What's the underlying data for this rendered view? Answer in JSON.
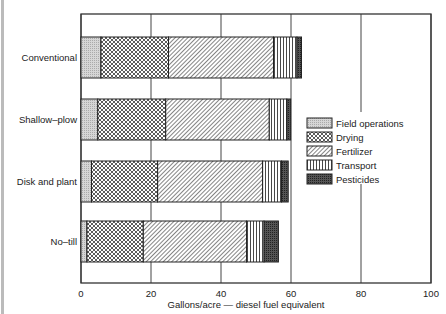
{
  "chart_data": {
    "type": "bar",
    "orientation": "horizontal",
    "stacked": true,
    "title": "",
    "xlabel": "Gallons/acre — diesel fuel equivalent",
    "ylabel": "",
    "xlim": [
      0,
      100
    ],
    "xticks": [
      0,
      20,
      40,
      60,
      80,
      100
    ],
    "grid": true,
    "legend_position": "right-middle inside",
    "categories": [
      "Conventional",
      "Shallow–plow",
      "Disk and plant",
      "No–till"
    ],
    "series": [
      {
        "name": "Field operations",
        "pattern": "stipple-light",
        "values": [
          5.7,
          4.8,
          3.0,
          1.7
        ]
      },
      {
        "name": "Drying",
        "pattern": "crosshatch",
        "values": [
          19.3,
          19.4,
          18.9,
          16.1
        ]
      },
      {
        "name": "Fertilizer",
        "pattern": "diagonal",
        "values": [
          30.0,
          29.6,
          30.0,
          29.5
        ]
      },
      {
        "name": "Transport",
        "pattern": "vertical-lines",
        "values": [
          6.7,
          5.0,
          5.4,
          5.0
        ]
      },
      {
        "name": "Pesticides",
        "pattern": "dark-stipple",
        "values": [
          1.3,
          1.1,
          1.9,
          4.1
        ]
      }
    ],
    "totals": [
      63.0,
      59.9,
      59.2,
      56.4
    ]
  },
  "colors": {
    "ink": "#222222",
    "field_fill": "#d0d0d0",
    "pesticide_fill": "#555555",
    "grid": "#444444"
  }
}
